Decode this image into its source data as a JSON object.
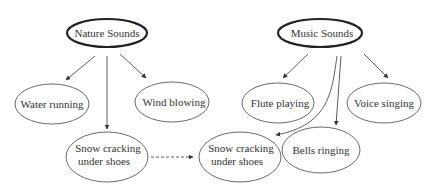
{
  "diagram": {
    "title": "",
    "colors": {
      "stroke": "#333333",
      "text": "#333333",
      "background": "#ffffff"
    },
    "nodes": [
      {
        "id": "nature",
        "label": "Nature Sounds",
        "lines": [
          "Nature Sounds"
        ],
        "cx": 107,
        "cy": 33,
        "rx": 40,
        "ry": 14,
        "root": true
      },
      {
        "id": "music",
        "label": "Music Sounds",
        "lines": [
          "Music Sounds"
        ],
        "cx": 320,
        "cy": 33,
        "rx": 42,
        "ry": 14,
        "root": true
      },
      {
        "id": "water",
        "label": "Water running",
        "lines": [
          "Water running"
        ],
        "cx": 52,
        "cy": 104,
        "rx": 37,
        "ry": 20
      },
      {
        "id": "wind",
        "label": "Wind blowing",
        "lines": [
          "Wind blowing"
        ],
        "cx": 172,
        "cy": 102,
        "rx": 37,
        "ry": 20
      },
      {
        "id": "flute",
        "label": "Flute playing",
        "lines": [
          "Flute playing"
        ],
        "cx": 278,
        "cy": 103,
        "rx": 36,
        "ry": 20
      },
      {
        "id": "voice",
        "label": "Voice singing",
        "lines": [
          "Voice singing"
        ],
        "cx": 384,
        "cy": 103,
        "rx": 37,
        "ry": 20
      },
      {
        "id": "snow1",
        "label": "Snow cracking under shoes",
        "lines": [
          "Snow cracking",
          "under shoes"
        ],
        "cx": 107,
        "cy": 157,
        "rx": 41,
        "ry": 25
      },
      {
        "id": "snow2",
        "label": "Snow cracking under shoes",
        "lines": [
          "Snow cracking",
          "under shoes"
        ],
        "cx": 240,
        "cy": 157,
        "rx": 41,
        "ry": 25
      },
      {
        "id": "bells",
        "label": "Bells ringing",
        "lines": [
          "Bells ringing"
        ],
        "cx": 321,
        "cy": 150,
        "rx": 39,
        "ry": 23
      }
    ],
    "edges": [
      {
        "from": "nature",
        "to": "water",
        "style": "solid"
      },
      {
        "from": "nature",
        "to": "snow1",
        "style": "solid"
      },
      {
        "from": "nature",
        "to": "wind",
        "style": "solid"
      },
      {
        "from": "music",
        "to": "flute",
        "style": "solid"
      },
      {
        "from": "music",
        "to": "snow2",
        "style": "solid",
        "curved": true
      },
      {
        "from": "music",
        "to": "bells",
        "style": "solid"
      },
      {
        "from": "music",
        "to": "voice",
        "style": "solid"
      },
      {
        "from": "snow1",
        "to": "snow2",
        "style": "dashed"
      }
    ]
  }
}
